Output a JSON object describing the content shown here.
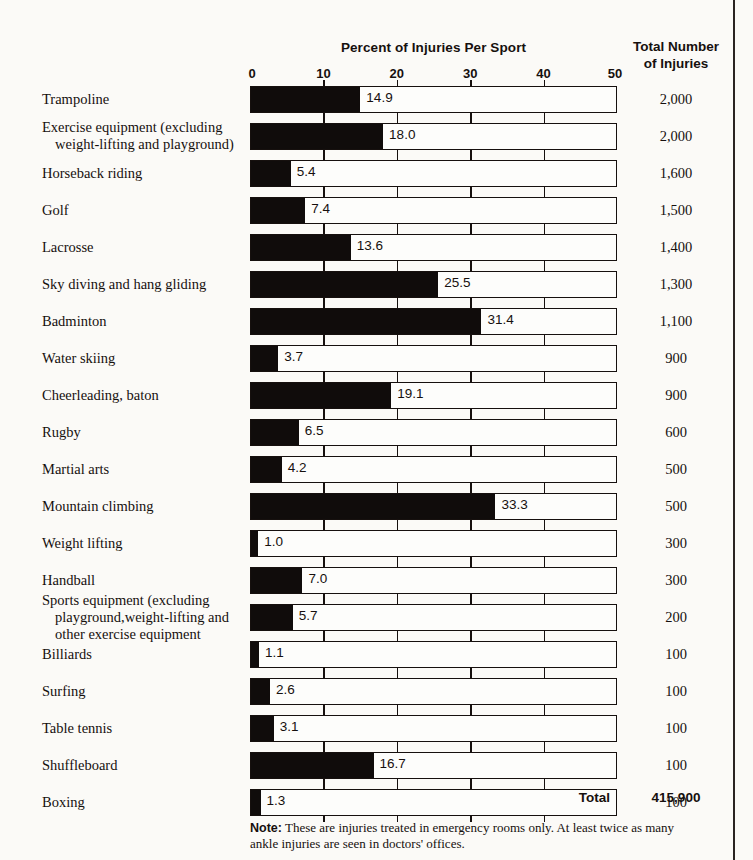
{
  "header": {
    "chart_title": "Percent of Injuries Per Sport",
    "totals_header_line1": "Total Number",
    "totals_header_line2": "of Injuries"
  },
  "footer": {
    "total_label": "Total",
    "total_value": "415,900",
    "note_prefix": "Note:",
    "note_text": " These are injuries treated in emergency rooms only. At least twice as many ankle injuries are seen in doctors' offices."
  },
  "chart_data": {
    "type": "bar",
    "orientation": "horizontal",
    "title": "Percent of Injuries Per Sport",
    "xlabel": "Percent of Injuries Per Sport",
    "ylabel": "",
    "xlim": [
      0,
      50
    ],
    "xticks": [
      0,
      10,
      20,
      30,
      40,
      50
    ],
    "xtick_labels": [
      "0",
      "10",
      "20",
      "30",
      "40",
      "50"
    ],
    "grid": true,
    "legend": "none",
    "bar_color": "#100c0b",
    "frame_color": "#16100e",
    "value_series_name": "Percent of Injuries Per Sport",
    "totals_series_name": "Total Number of Injuries",
    "categories": [
      "Trampoline",
      "Exercise equipment (excluding weight-lifting and playground)",
      "Horseback riding",
      "Golf",
      "Lacrosse",
      "Sky diving and hang gliding",
      "Badminton",
      "Water skiing",
      "Cheerleading, baton",
      "Rugby",
      "Martial arts",
      "Mountain climbing",
      "Weight lifting",
      "Handball",
      "Sports equipment (excluding playground, weight-lifting and other exercise equipment",
      "Billiards",
      "Surfing",
      "Table tennis",
      "Shuffleboard",
      "Boxing"
    ],
    "values": [
      14.9,
      18.0,
      5.4,
      7.4,
      13.6,
      25.5,
      31.4,
      3.7,
      19.1,
      6.5,
      4.2,
      33.3,
      1.0,
      7.0,
      5.7,
      1.1,
      2.6,
      3.1,
      16.7,
      1.3
    ],
    "totals": [
      2000,
      2000,
      1600,
      1500,
      1400,
      1300,
      1100,
      900,
      900,
      600,
      500,
      500,
      300,
      300,
      200,
      100,
      100,
      100,
      100,
      100
    ],
    "total_sum": 415900
  },
  "rows": [
    {
      "label_lines": [
        "Trampoline"
      ],
      "value": 14.9,
      "value_label": "14.9",
      "total_label": "2,000"
    },
    {
      "label_lines": [
        "Exercise equipment (excluding",
        "weight-lifting and playground)"
      ],
      "value": 18.0,
      "value_label": "18.0",
      "total_label": "2,000"
    },
    {
      "label_lines": [
        "Horseback riding"
      ],
      "value": 5.4,
      "value_label": "5.4",
      "total_label": "1,600"
    },
    {
      "label_lines": [
        "Golf"
      ],
      "value": 7.4,
      "value_label": "7.4",
      "total_label": "1,500"
    },
    {
      "label_lines": [
        "Lacrosse"
      ],
      "value": 13.6,
      "value_label": "13.6",
      "total_label": "1,400"
    },
    {
      "label_lines": [
        "Sky diving and hang gliding"
      ],
      "value": 25.5,
      "value_label": "25.5",
      "total_label": "1,300"
    },
    {
      "label_lines": [
        "Badminton"
      ],
      "value": 31.4,
      "value_label": "31.4",
      "total_label": "1,100"
    },
    {
      "label_lines": [
        "Water skiing"
      ],
      "value": 3.7,
      "value_label": "3.7",
      "total_label": "900"
    },
    {
      "label_lines": [
        "Cheerleading, baton"
      ],
      "value": 19.1,
      "value_label": "19.1",
      "total_label": "900"
    },
    {
      "label_lines": [
        "Rugby"
      ],
      "value": 6.5,
      "value_label": "6.5",
      "total_label": "600"
    },
    {
      "label_lines": [
        "Martial arts"
      ],
      "value": 4.2,
      "value_label": "4.2",
      "total_label": "500"
    },
    {
      "label_lines": [
        "Mountain climbing"
      ],
      "value": 33.3,
      "value_label": "33.3",
      "total_label": "500"
    },
    {
      "label_lines": [
        "Weight lifting"
      ],
      "value": 1.0,
      "value_label": "1.0",
      "total_label": "300"
    },
    {
      "label_lines": [
        "Handball"
      ],
      "value": 7.0,
      "value_label": "7.0",
      "total_label": "300"
    },
    {
      "label_lines": [
        "Sports equipment (excluding",
        "playground,weight-lifting and",
        "other exercise equipment"
      ],
      "value": 5.7,
      "value_label": "5.7",
      "total_label": "200"
    },
    {
      "label_lines": [
        "Billiards"
      ],
      "value": 1.1,
      "value_label": "1.1",
      "total_label": "100"
    },
    {
      "label_lines": [
        "Surfing"
      ],
      "value": 2.6,
      "value_label": "2.6",
      "total_label": "100"
    },
    {
      "label_lines": [
        "Table tennis"
      ],
      "value": 3.1,
      "value_label": "3.1",
      "total_label": "100"
    },
    {
      "label_lines": [
        "Shuffleboard"
      ],
      "value": 16.7,
      "value_label": "16.7",
      "total_label": "100"
    },
    {
      "label_lines": [
        "Boxing"
      ],
      "value": 1.3,
      "value_label": "1.3",
      "total_label": "100"
    }
  ]
}
